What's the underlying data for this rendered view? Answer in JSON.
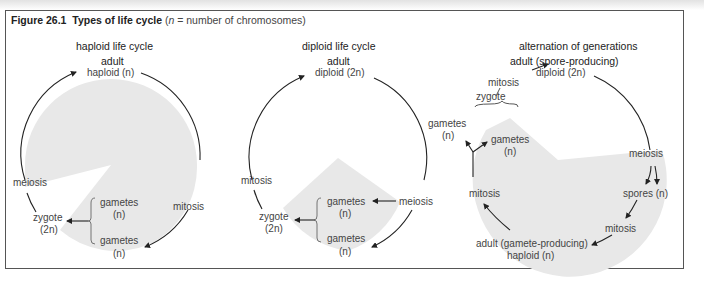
{
  "figure": {
    "label": "Figure 26.1",
    "title": "Types of life cycle",
    "note_prefix": "(",
    "note_var": "n",
    "note_rest": " = number of chromosomes)"
  },
  "panels": [
    {
      "heading": "haploid life cycle",
      "labels": {
        "adult": "adult",
        "adult_ploidy": "haploid (n)",
        "meiosis": "meiosis",
        "mitosis": "mitosis",
        "zygote": "zygote",
        "zygote_ploidy": "(2n)",
        "gametes_1": "gametes",
        "gametes_1_ploidy": "(n)",
        "gametes_2": "gametes",
        "gametes_2_ploidy": "(n)"
      }
    },
    {
      "heading": "diploid life cycle",
      "labels": {
        "adult": "adult",
        "adult_ploidy": "diploid (2n)",
        "mitosis": "mitosis",
        "meiosis": "meiosis",
        "zygote": "zygote",
        "zygote_ploidy": "(2n)",
        "gametes_1": "gametes",
        "gametes_1_ploidy": "(n)",
        "gametes_2": "gametes",
        "gametes_2_ploidy": "(n)"
      }
    },
    {
      "heading": "alternation of generations",
      "labels": {
        "adult_sporophyte": "adult (spore-producing)",
        "sporophyte_ploidy": "diploid (2n)",
        "mitosis_top": "mitosis",
        "zygote": "zygote",
        "gametes_1": "gametes",
        "gametes_1_ploidy": "(n)",
        "gametes_2": "gametes",
        "gametes_2_ploidy": "(n)",
        "meiosis": "meiosis",
        "spores": "spores (n)",
        "mitosis_right": "mitosis",
        "mitosis_left": "mitosis",
        "adult_gametophyte": "adult (gamete-producing)",
        "gametophyte_ploidy": "haploid (n)"
      }
    }
  ],
  "colors": {
    "shade": "#e8e8e8",
    "line": "#222222",
    "text": "#444444"
  }
}
